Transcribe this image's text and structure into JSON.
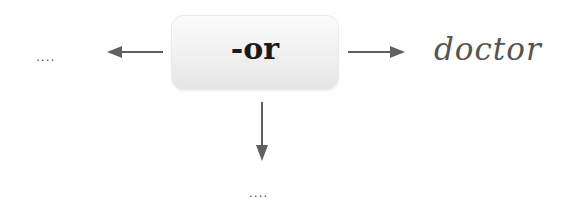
{
  "diagram": {
    "central_node": {
      "label": "-or"
    },
    "right_node": {
      "label": "doctor"
    },
    "left_node": {
      "label": "...."
    },
    "bottom_node": {
      "label": "...."
    },
    "edges": [
      {
        "from": "-or",
        "to": "....",
        "direction": "left"
      },
      {
        "from": "-or",
        "to": "doctor",
        "direction": "right"
      },
      {
        "from": "-or",
        "to": "....",
        "direction": "down"
      }
    ],
    "colors": {
      "arrow": "#606060",
      "box_fill": "#f0f0f0",
      "central_text": "#1a1a1a",
      "example_text": "#555555"
    }
  }
}
